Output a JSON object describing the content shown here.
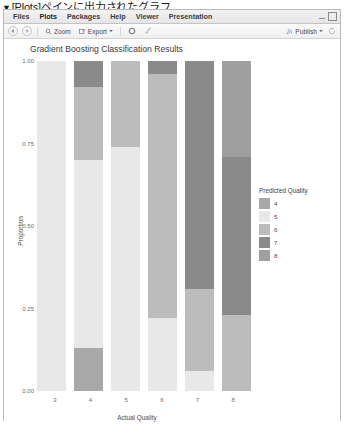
{
  "caption": {
    "marker": "▼",
    "text": "[Plots]ペインに出力されたグラフ"
  },
  "window": {
    "tabs": [
      {
        "label": "Files",
        "active": false
      },
      {
        "label": "Plots",
        "active": true
      },
      {
        "label": "Packages",
        "active": false
      },
      {
        "label": "Help",
        "active": false
      },
      {
        "label": "Viewer",
        "active": false
      },
      {
        "label": "Presentation",
        "active": false
      }
    ],
    "controls": {
      "minimize": "minimize-icon",
      "maximize": "maximize-icon"
    }
  },
  "toolbar": {
    "back": "back-arrow-icon",
    "forward": "forward-arrow-icon",
    "zoom_label": "Zoom",
    "zoom_icon": "magnifier-icon",
    "export_label": "Export",
    "export_icon": "export-icon",
    "export_caret": "chevron-down-icon",
    "remove_icon": "remove-plot-icon",
    "clear_icon": "broom-icon",
    "publish_label": "Publish",
    "publish_icon": "publish-icon",
    "publish_caret": "chevron-down-icon",
    "refresh_icon": "refresh-icon"
  },
  "chart_data": {
    "type": "bar",
    "stacked": true,
    "normalized": true,
    "title": "Gradient Boosting Classification Results",
    "xlabel": "Actual Quality",
    "ylabel": "Proportion",
    "categories": [
      "3",
      "4",
      "5",
      "6",
      "7",
      "8"
    ],
    "ylim": [
      0,
      1
    ],
    "yticks": [
      "0.00",
      "0.25",
      "0.50",
      "0.75",
      "1.00"
    ],
    "ytick_values": [
      0,
      0.25,
      0.5,
      0.75,
      1
    ],
    "grid": false,
    "legend": {
      "title": "Predicted Quality",
      "position": "right",
      "entries": [
        {
          "label": "4",
          "color": "#a8a8a8"
        },
        {
          "label": "5",
          "color": "#e8e8e8"
        },
        {
          "label": "6",
          "color": "#bcbcbc"
        },
        {
          "label": "7",
          "color": "#8a8a8a"
        },
        {
          "label": "8",
          "color": "#9f9f9f"
        }
      ]
    },
    "series": [
      {
        "name": "4",
        "color": "#a8a8a8",
        "values": [
          0.0,
          0.13,
          0.0,
          0.0,
          0.0,
          0.0
        ]
      },
      {
        "name": "5",
        "color": "#e8e8e8",
        "values": [
          1.0,
          0.57,
          0.74,
          0.22,
          0.06,
          0.0
        ]
      },
      {
        "name": "6",
        "color": "#bcbcbc",
        "values": [
          0.0,
          0.22,
          0.26,
          0.74,
          0.25,
          0.23
        ]
      },
      {
        "name": "7",
        "color": "#8a8a8a",
        "values": [
          0.0,
          0.08,
          0.0,
          0.04,
          0.69,
          0.48
        ]
      },
      {
        "name": "8",
        "color": "#9f9f9f",
        "values": [
          0.0,
          0.0,
          0.0,
          0.0,
          0.0,
          0.29
        ]
      }
    ]
  }
}
